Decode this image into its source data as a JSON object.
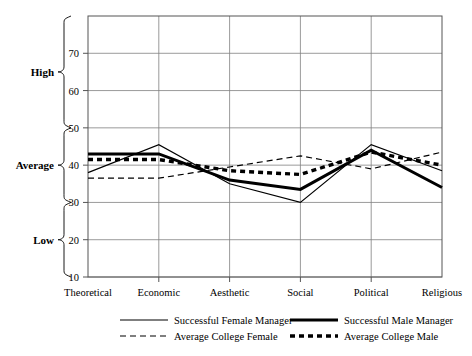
{
  "chart_data": {
    "type": "line",
    "title": "",
    "xlabel": "",
    "ylabel": "",
    "categories": [
      "Theoretical",
      "Economic",
      "Aesthetic",
      "Social",
      "Political",
      "Religious"
    ],
    "ylim": [
      10,
      80
    ],
    "yticks": [
      10,
      20,
      30,
      40,
      50,
      60,
      70
    ],
    "ytick_labels": [
      "10",
      "20",
      "30",
      "40",
      "50",
      "60",
      "70"
    ],
    "grid": true,
    "legend_position": "bottom",
    "band_labels": [
      {
        "label": "High",
        "range": [
          50,
          80
        ]
      },
      {
        "label": "Average",
        "range": [
          30,
          50
        ]
      },
      {
        "label": "Low",
        "range": [
          10,
          30
        ]
      }
    ],
    "series": [
      {
        "name": "Successful Female Manager",
        "style": "solid-thin",
        "values": [
          38,
          45.5,
          35,
          30,
          45.5,
          38.5
        ]
      },
      {
        "name": "Successful Male Manager",
        "style": "solid-thick",
        "values": [
          43,
          43,
          36,
          33.5,
          44,
          34
        ]
      },
      {
        "name": "Average College Female",
        "style": "dashed-thin",
        "values": [
          36.5,
          36.5,
          39.5,
          42.5,
          39,
          43.5
        ]
      },
      {
        "name": "Average College Male",
        "style": "dotted-thick",
        "values": [
          41.5,
          41.5,
          38.5,
          37.5,
          43.5,
          40
        ]
      }
    ]
  },
  "colors": {
    "line": "#000000",
    "grid": "#808080",
    "frame": "#555555",
    "background": "#ffffff"
  }
}
